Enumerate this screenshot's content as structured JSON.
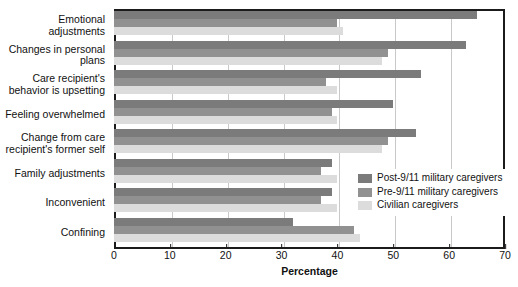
{
  "chart_data": {
    "type": "bar",
    "orientation": "horizontal",
    "title": "",
    "xlabel": "Percentage",
    "ylabel": "",
    "xlim": [
      0,
      70
    ],
    "xticks": [
      0,
      10,
      20,
      30,
      40,
      50,
      60,
      70
    ],
    "grid": "vertical",
    "legend_position": "inside-right",
    "categories": [
      "Emotional adjustments",
      "Changes in personal plans",
      "Care recipient's behavior is upsetting",
      "Feeling overwhelmed",
      "Change from care recipient's former self",
      "Family adjustments",
      "Inconvenient",
      "Confining"
    ],
    "series": [
      {
        "name": "Post-9/11 military caregivers",
        "color": "#7b7b7b",
        "values": [
          65,
          63,
          55,
          50,
          54,
          39,
          39,
          32
        ]
      },
      {
        "name": "Pre-9/11 military caregivers",
        "color": "#919191",
        "values": [
          40,
          49,
          38,
          39,
          49,
          37,
          37,
          43
        ]
      },
      {
        "name": "Civilian caregivers",
        "color": "#dcdcdc",
        "values": [
          41,
          48,
          40,
          40,
          48,
          40,
          40,
          44
        ]
      }
    ]
  },
  "axis": {
    "x_title": "Percentage"
  },
  "legend": {
    "items": [
      {
        "label": "Post-9/11 military caregivers",
        "color": "#7b7b7b"
      },
      {
        "label": "Pre-9/11 military caregivers",
        "color": "#919191"
      },
      {
        "label": "Civilian caregivers",
        "color": "#dcdcdc"
      }
    ]
  }
}
